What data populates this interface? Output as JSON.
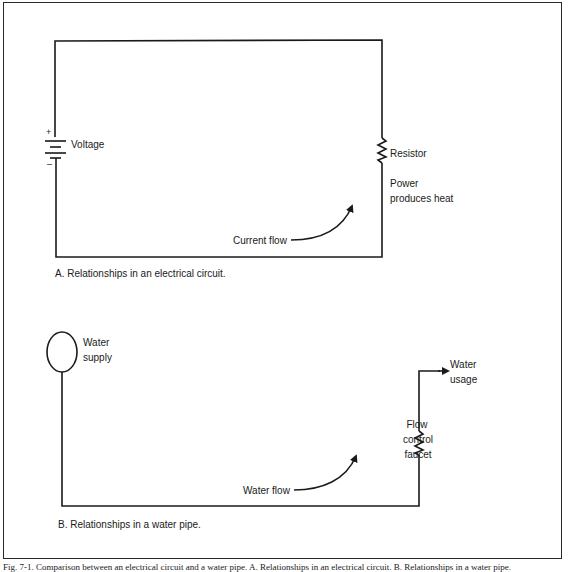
{
  "panel_a": {
    "voltage_label": "Voltage",
    "plus_sign": "+",
    "minus_sign": "–",
    "resistor_label": "Resistor",
    "power_line1": "Power",
    "power_line2": "produces heat",
    "flow_label": "Current flow",
    "caption": "A. Relationships in an electrical circuit."
  },
  "panel_b": {
    "supply_line1": "Water",
    "supply_line2": "supply",
    "usage_line1": "Water",
    "usage_line2": "usage",
    "faucet_line1": "Flow",
    "faucet_line2": "control",
    "faucet_line3": "faucet",
    "flow_label": "Water flow",
    "caption": "B. Relationships in a water pipe."
  },
  "figure_caption": "Fig. 7-1. Comparison between an electrical circuit and a water pipe. A. Relationships in an electrical circuit. B. Relationships in a water pipe."
}
